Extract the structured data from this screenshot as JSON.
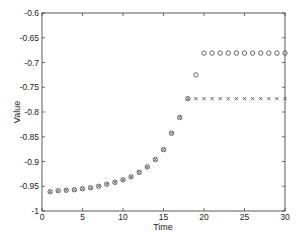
{
  "chart_data": {
    "type": "scatter",
    "title": "",
    "xlabel": "Time",
    "ylabel": "Value",
    "xlim": [
      0,
      30
    ],
    "ylim": [
      -1,
      -0.6
    ],
    "xticks": [
      0,
      5,
      10,
      15,
      20,
      25,
      30
    ],
    "yticks": [
      -1,
      -0.95,
      -0.9,
      -0.85,
      -0.8,
      -0.75,
      -0.7,
      -0.65,
      -0.6
    ],
    "ytick_labels": [
      "-1",
      "-0.95",
      "-0.9",
      "-0.85",
      "-0.8",
      "-0.75",
      "-0.7",
      "-0.65",
      "-0.6"
    ],
    "grid": false,
    "legend": null,
    "series": [
      {
        "name": "circles",
        "marker": "o",
        "color": "#555555",
        "x": [
          1,
          2,
          3,
          4,
          5,
          6,
          7,
          8,
          9,
          10,
          11,
          12,
          13,
          14,
          15,
          16,
          17,
          18,
          19,
          20,
          21,
          22,
          23,
          24,
          25,
          26,
          27,
          28,
          29,
          30
        ],
        "y": [
          -0.961,
          -0.959,
          -0.958,
          -0.957,
          -0.955,
          -0.953,
          -0.95,
          -0.946,
          -0.942,
          -0.937,
          -0.931,
          -0.922,
          -0.911,
          -0.896,
          -0.876,
          -0.843,
          -0.811,
          -0.773,
          -0.725,
          -0.681,
          -0.681,
          -0.681,
          -0.681,
          -0.681,
          -0.681,
          -0.681,
          -0.681,
          -0.681,
          -0.681,
          -0.681
        ]
      },
      {
        "name": "crosses",
        "marker": "x",
        "color": "#555555",
        "x": [
          1,
          2,
          3,
          4,
          5,
          6,
          7,
          8,
          9,
          10,
          11,
          12,
          13,
          14,
          15,
          16,
          17,
          18,
          19,
          20,
          21,
          22,
          23,
          24,
          25,
          26,
          27,
          28,
          29,
          30
        ],
        "y": [
          -0.961,
          -0.959,
          -0.958,
          -0.957,
          -0.955,
          -0.953,
          -0.95,
          -0.946,
          -0.942,
          -0.937,
          -0.931,
          -0.922,
          -0.911,
          -0.896,
          -0.876,
          -0.843,
          -0.811,
          -0.773,
          -0.773,
          -0.773,
          -0.773,
          -0.773,
          -0.773,
          -0.773,
          -0.773,
          -0.773,
          -0.773,
          -0.773,
          -0.773,
          -0.773
        ]
      }
    ]
  },
  "labels": {
    "xlabel": "Time",
    "ylabel": "Value"
  }
}
